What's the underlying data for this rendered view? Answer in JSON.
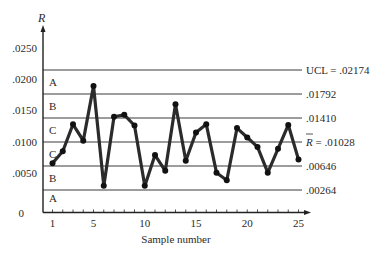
{
  "chart_data": {
    "type": "line",
    "title": "",
    "xlabel": "Sample number",
    "ylabel": "R",
    "ylim": [
      0,
      0.025
    ],
    "xlim": [
      1,
      25
    ],
    "grid": false,
    "y_ticks": [
      {
        "value": 0,
        "label": "0"
      },
      {
        "value": 0.005,
        "label": ".0050"
      },
      {
        "value": 0.01,
        "label": ".0100"
      },
      {
        "value": 0.015,
        "label": ".0150"
      },
      {
        "value": 0.02,
        "label": ".0200"
      },
      {
        "value": 0.025,
        "label": ".0250"
      }
    ],
    "x_ticks": [
      {
        "value": 1,
        "label": "1"
      },
      {
        "value": 5,
        "label": "5"
      },
      {
        "value": 10,
        "label": "10"
      },
      {
        "value": 15,
        "label": "15"
      },
      {
        "value": 20,
        "label": "20"
      },
      {
        "value": 25,
        "label": "25"
      }
    ],
    "control_lines": [
      {
        "name": "UCL",
        "value": 0.02174,
        "label": "UCL = .02174"
      },
      {
        "name": "upper_2sigma",
        "value": 0.01792,
        "label": ".01792"
      },
      {
        "name": "upper_1sigma",
        "value": 0.0141,
        "label": ".01410"
      },
      {
        "name": "center_line",
        "value": 0.01028,
        "label": "R̄ = .01028",
        "label_prefix": "R",
        "label_suffix": " = .01028"
      },
      {
        "name": "lower_1sigma",
        "value": 0.00646,
        "label": ".00646"
      },
      {
        "name": "lower_2sigma",
        "value": 0.00264,
        "label": ".00264"
      }
    ],
    "zones": [
      {
        "label": "A",
        "from": 0.01792,
        "to": 0.02174
      },
      {
        "label": "B",
        "from": 0.0141,
        "to": 0.01792
      },
      {
        "label": "C",
        "from": 0.01028,
        "to": 0.0141
      },
      {
        "label": "C",
        "from": 0.00646,
        "to": 0.01028
      },
      {
        "label": "B",
        "from": 0.00264,
        "to": 0.00646
      },
      {
        "label": "A",
        "from": 0.0,
        "to": 0.00264
      }
    ],
    "series": [
      {
        "name": "R",
        "x": [
          1,
          2,
          3,
          4,
          5,
          6,
          7,
          8,
          9,
          10,
          11,
          12,
          13,
          14,
          15,
          16,
          17,
          18,
          19,
          20,
          21,
          22,
          23,
          24,
          25
        ],
        "values": [
          0.0069,
          0.0088,
          0.0131,
          0.0105,
          0.0192,
          0.0033,
          0.0143,
          0.0146,
          0.0129,
          0.0033,
          0.0082,
          0.0057,
          0.0163,
          0.0073,
          0.0118,
          0.0131,
          0.0054,
          0.0042,
          0.0125,
          0.011,
          0.0095,
          0.0054,
          0.0092,
          0.013,
          0.0075
        ]
      }
    ],
    "colors": {
      "series": "#2b2b2b",
      "lines": "#3a3a3a",
      "text": "#2a2a2a"
    }
  }
}
